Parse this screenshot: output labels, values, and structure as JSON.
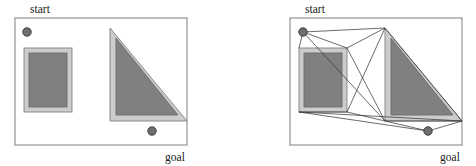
{
  "figure": {
    "title": "",
    "width": 476,
    "height": 166,
    "background": "#ffffff",
    "panel_count": 2
  },
  "style": {
    "frame_stroke": "#8a8a8a",
    "frame_fill": "#ffffff",
    "obstacle_fill": "#808080",
    "obstacle_buffer_fill": "#cccccc",
    "obstacle_stroke": "#6b6b6b",
    "node_fill": "#6e6e6e",
    "node_stroke": "#3c3c3c",
    "edge_stroke": "#3a3a3a",
    "label_color": "#1a1a1a"
  },
  "panels": [
    {
      "id": "left-panel",
      "name": "workspace-with-obstacles",
      "offset_x": 0,
      "frame": {
        "x": 15,
        "y": 18,
        "width": 172,
        "height": 127
      },
      "labels": [
        {
          "name": "start-label",
          "text": "start",
          "x": 40,
          "y": 13,
          "anchor": "middle"
        },
        {
          "name": "goal-label",
          "text": "goal",
          "x": 175,
          "y": 161,
          "anchor": "middle"
        }
      ],
      "nodes": [
        {
          "name": "start-node",
          "x": 27,
          "y": 32,
          "r": 4.2
        },
        {
          "name": "goal-node",
          "x": 152,
          "y": 131,
          "r": 4.2
        }
      ],
      "obstacles": [
        {
          "name": "rectangle-obstacle",
          "type": "rect",
          "buffer": {
            "x": 24,
            "y": 48,
            "width": 48,
            "height": 64
          },
          "core": {
            "x": 29,
            "y": 53,
            "width": 38,
            "height": 54
          }
        },
        {
          "name": "triangle-obstacle",
          "type": "triangle",
          "buffer_points": "110,28 187,121 110,121",
          "core_points": "116,38 178,115 116,115"
        }
      ],
      "edges": []
    },
    {
      "id": "right-panel",
      "name": "visibility-graph",
      "offset_x": 238,
      "frame": {
        "x": 52,
        "y": 18,
        "width": 172,
        "height": 127
      },
      "labels": [
        {
          "name": "start-label",
          "text": "start",
          "x": 77,
          "y": 13,
          "anchor": "middle"
        },
        {
          "name": "goal-label",
          "text": "goal",
          "x": 212,
          "y": 161,
          "anchor": "middle"
        }
      ],
      "nodes": [
        {
          "name": "start-node",
          "x": 65,
          "y": 32,
          "r": 4.2
        },
        {
          "name": "goal-node",
          "x": 190,
          "y": 131,
          "r": 4.2
        }
      ],
      "obstacles": [
        {
          "name": "rectangle-obstacle",
          "type": "rect",
          "buffer": {
            "x": 61,
            "y": 48,
            "width": 48,
            "height": 64
          },
          "core": {
            "x": 66,
            "y": 53,
            "width": 38,
            "height": 54
          }
        },
        {
          "name": "triangle-obstacle",
          "type": "triangle",
          "buffer_points": "147,28 224,121 147,121",
          "core_points": "153,38 215,115 153,115"
        }
      ],
      "edges": [
        {
          "name": "edge-start-to-rect-tr",
          "x1": 65,
          "y1": 32,
          "x2": 109,
          "y2": 48
        },
        {
          "name": "edge-start-to-rect-tl",
          "x1": 65,
          "y1": 32,
          "x2": 61,
          "y2": 48
        },
        {
          "name": "edge-start-to-tri-apex",
          "x1": 65,
          "y1": 32,
          "x2": 147,
          "y2": 28
        },
        {
          "name": "edge-start-to-tri-bl",
          "x1": 65,
          "y1": 32,
          "x2": 147,
          "y2": 121
        },
        {
          "name": "edge-recttr-to-triapex",
          "x1": 109,
          "y1": 48,
          "x2": 147,
          "y2": 28
        },
        {
          "name": "edge-recttr-to-tribl",
          "x1": 109,
          "y1": 48,
          "x2": 147,
          "y2": 121
        },
        {
          "name": "edge-rectbr-to-triapex",
          "x1": 109,
          "y1": 112,
          "x2": 147,
          "y2": 28
        },
        {
          "name": "edge-rectbr-to-tribl",
          "x1": 109,
          "y1": 112,
          "x2": 147,
          "y2": 121
        },
        {
          "name": "edge-rectbl-to-rectbr",
          "x1": 61,
          "y1": 112,
          "x2": 109,
          "y2": 112
        },
        {
          "name": "edge-rectbl-to-goal",
          "x1": 61,
          "y1": 112,
          "x2": 190,
          "y2": 131
        },
        {
          "name": "edge-rectbl-to-trival",
          "x1": 61,
          "y1": 112,
          "x2": 224,
          "y2": 121
        },
        {
          "name": "edge-triapex-to-trival",
          "x1": 147,
          "y1": 28,
          "x2": 224,
          "y2": 121
        },
        {
          "name": "edge-tribl-to-trival",
          "x1": 147,
          "y1": 121,
          "x2": 224,
          "y2": 121
        },
        {
          "name": "edge-goal-to-trival",
          "x1": 190,
          "y1": 131,
          "x2": 224,
          "y2": 121
        },
        {
          "name": "edge-goal-to-tribl",
          "x1": 190,
          "y1": 131,
          "x2": 147,
          "y2": 121
        }
      ]
    }
  ]
}
